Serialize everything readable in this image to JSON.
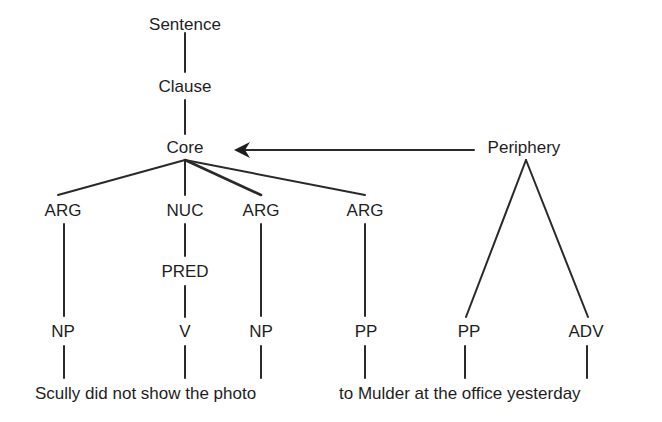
{
  "diagram": {
    "type": "tree",
    "nodes": {
      "sentence": "Sentence",
      "clause": "Clause",
      "core": "Core",
      "periphery": "Periphery",
      "arg1": "ARG",
      "nuc": "NUC",
      "arg2": "ARG",
      "arg3": "ARG",
      "pred": "PRED",
      "np1": "NP",
      "v": "V",
      "np2": "NP",
      "pp1": "PP",
      "pp2": "PP",
      "adv": "ADV"
    },
    "text": {
      "part1": "Scully did not show the photo",
      "part2": "to Mulder at the office yesterday"
    },
    "edges": [
      [
        "Sentence",
        "Clause"
      ],
      [
        "Clause",
        "Core"
      ],
      [
        "Core",
        "ARG"
      ],
      [
        "Core",
        "NUC"
      ],
      [
        "Core",
        "ARG"
      ],
      [
        "Core",
        "ARG"
      ],
      [
        "NUC",
        "PRED"
      ],
      [
        "PRED",
        "V"
      ],
      [
        "ARG",
        "NP"
      ],
      [
        "ARG",
        "NP"
      ],
      [
        "ARG",
        "PP"
      ],
      [
        "Periphery",
        "PP"
      ],
      [
        "Periphery",
        "ADV"
      ]
    ],
    "arrow": {
      "from": "Periphery",
      "to": "Core"
    }
  }
}
